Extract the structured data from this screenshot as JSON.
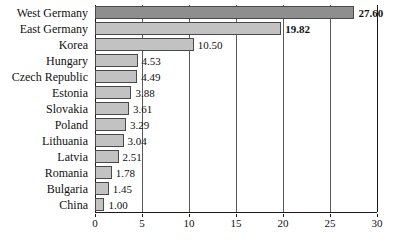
{
  "chart_data": {
    "type": "bar",
    "orientation": "horizontal",
    "title": "",
    "subtitle": "",
    "xlabel": "",
    "ylabel": "",
    "categories": [
      "West Germany",
      "East Germany",
      "Korea",
      "Hungary",
      "Czech Republic",
      "Estonia",
      "Slovakia",
      "Poland",
      "Lithuania",
      "Latvia",
      "Romania",
      "Bulgaria",
      "China"
    ],
    "values": [
      27.6,
      19.82,
      10.5,
      4.53,
      4.49,
      3.88,
      3.61,
      3.29,
      3.04,
      2.51,
      1.78,
      1.45,
      1.0
    ],
    "value_labels": [
      "27.60",
      "19.82",
      "10.50",
      "4.53",
      "4.49",
      "3.88",
      "3.61",
      "3.29",
      "3.04",
      "2.51",
      "1.78",
      "1.45",
      "1.00"
    ],
    "bold_labels": [
      true,
      true,
      false,
      false,
      false,
      false,
      false,
      false,
      false,
      false,
      false,
      false,
      false
    ],
    "bar_colors": [
      "#8e8e8e",
      "#c2c2c2",
      "#c2c2c2",
      "#c2c2c2",
      "#c2c2c2",
      "#c2c2c2",
      "#c2c2c2",
      "#c2c2c2",
      "#c2c2c2",
      "#c2c2c2",
      "#c2c2c2",
      "#c2c2c2",
      "#c2c2c2"
    ],
    "xlim": [
      0,
      30
    ],
    "xticks": [
      0,
      5,
      10,
      15,
      20,
      25,
      30
    ],
    "xtick_labels": [
      "0",
      "5",
      "10",
      "15",
      "20",
      "25",
      "30"
    ],
    "grid": true,
    "grid_axis": "x",
    "legend": null,
    "legend_position": "none",
    "annotations": []
  },
  "style": {
    "bar_fill": "#c2c2c2",
    "bar_fill_highlight": "#8e8e8e",
    "bar_edge": "#4a4a4a",
    "axis_color": "#1a1a1a",
    "grid_color": "#5a5a5a",
    "text_color": "#111111",
    "background": "#ffffff"
  }
}
